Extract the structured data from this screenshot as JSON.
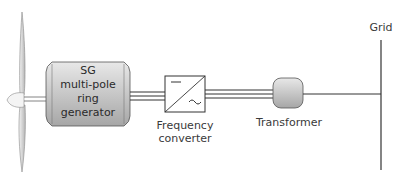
{
  "diagram": {
    "type": "wind turbine single-line diagram",
    "components": {
      "turbine": {
        "name": "Wind turbine rotor"
      },
      "generator": {
        "lines": [
          "SG",
          "multi-pole",
          "ring",
          "generator"
        ]
      },
      "converter": {
        "label_line1": "Frequency",
        "label_line2": "converter",
        "symbols": {
          "dc": "—",
          "ac": "~"
        }
      },
      "transformer": {
        "label": "Transformer"
      },
      "grid": {
        "label": "Grid"
      }
    },
    "colors": {
      "box_fill_top": "#e6e6e6",
      "box_fill_bottom": "#a9a9a9",
      "line": "#333333",
      "blade": "#d8d8d8"
    }
  }
}
